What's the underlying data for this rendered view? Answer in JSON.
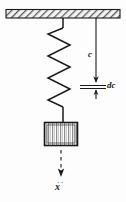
{
  "figure": {
    "name": "spring-mass-suspension-diagram",
    "title": "",
    "labels": {
      "length_c": "c",
      "increment_dc": "dc",
      "displacement_x": "x"
    },
    "colors": {
      "line": "#1a1a1a",
      "hatch": "#6e6e6e",
      "ceiling_fill": "#e8e8e8",
      "mass_fill": "#c9c9c9",
      "background": "#fdfdfd"
    },
    "elements": {
      "ceiling": "hatched-support-bar",
      "spring": "zigzag-coil-spring",
      "mass": "striped-mass-block",
      "dimension_c": "vertical-dimension-arrow",
      "dimension_dc": "small-increment-dimension",
      "displacement": "dashed-displacement-arrow"
    },
    "geometry": {
      "ceiling_x1": 6,
      "ceiling_x2": 120,
      "ceiling_y1": 9,
      "ceiling_y2": 18,
      "spring_top_x": 63,
      "spring_top_y": 18,
      "spring_coil_top": 28,
      "spring_coil_bottom": 112,
      "spring_left": 47,
      "spring_right": 70,
      "mass_x": 44,
      "mass_y": 122,
      "mass_w": 34,
      "mass_h": 24,
      "dim_line_x": 96,
      "dim_line_top": 18,
      "dim_line_bottom": 84,
      "dc_tick_upper": 85,
      "dc_tick_lower": 88,
      "disp_line_x": 61,
      "disp_line_top": 150,
      "disp_line_bottom": 176
    }
  }
}
